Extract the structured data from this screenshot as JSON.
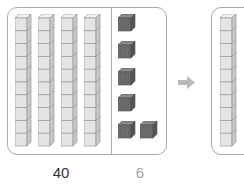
{
  "diagram": {
    "type": "base-ten-blocks",
    "left_panel": {
      "tens_rods": 4,
      "cubes_per_rod": 10,
      "ones_cubes": 6,
      "ones_layout_rows": [
        1,
        1,
        1,
        1,
        2
      ]
    },
    "arrow": {
      "icon": "right-arrow-icon",
      "direction": "right"
    },
    "right_panel": {
      "tens_rods": 1,
      "cubes_per_rod": 10
    },
    "labels": {
      "tens_value": "40",
      "ones_value": "6"
    },
    "colors": {
      "rod_face": "#e4e4e4",
      "rod_side": "#c8c8c8",
      "rod_top": "#f2f2f2",
      "rod_edge": "#8e8e8e",
      "unit_cube_front": "#6e6e6e",
      "unit_cube_top": "#8a8a8a",
      "unit_cube_side": "#555555",
      "panel_border": "#a9a9a9",
      "arrow": "#b9b9b9",
      "tens_label": "#333333",
      "ones_label": "#a0a0a0"
    }
  }
}
